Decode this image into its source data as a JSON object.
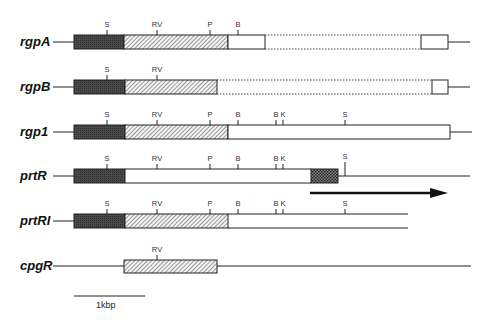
{
  "figure": {
    "type": "gene-map",
    "scale_bar": {
      "label": "1kbp"
    },
    "rows": [
      {
        "name": "rgpA",
        "sites": [
          {
            "label": "S",
            "x": 107
          },
          {
            "label": "RV",
            "x": 157
          },
          {
            "label": "P",
            "x": 210
          },
          {
            "label": "B",
            "x": 238
          }
        ],
        "segments": [
          "dark",
          "hatched",
          "open",
          "dotted",
          "open"
        ]
      },
      {
        "name": "rgpB",
        "sites": [
          {
            "label": "S",
            "x": 107
          },
          {
            "label": "RV",
            "x": 157
          }
        ],
        "segments": [
          "dark",
          "hatched",
          "dotted",
          "open"
        ]
      },
      {
        "name": "rgp1",
        "sites": [
          {
            "label": "S",
            "x": 107
          },
          {
            "label": "RV",
            "x": 157
          },
          {
            "label": "P",
            "x": 210
          },
          {
            "label": "B",
            "x": 238
          },
          {
            "label": "B",
            "x": 276
          },
          {
            "label": "K",
            "x": 283
          },
          {
            "label": "S",
            "x": 345
          }
        ],
        "segments": [
          "dark",
          "hatched",
          "open"
        ]
      },
      {
        "name": "prtR",
        "sites": [
          {
            "label": "S",
            "x": 107
          },
          {
            "label": "RV",
            "x": 157
          },
          {
            "label": "P",
            "x": 210
          },
          {
            "label": "B",
            "x": 238
          },
          {
            "label": "B",
            "x": 276
          },
          {
            "label": "K",
            "x": 283
          },
          {
            "label": "S",
            "x": 345
          }
        ],
        "segments": [
          "dark",
          "open",
          "stippled"
        ],
        "arrow": "transcription direction"
      },
      {
        "name": "prtRI",
        "sites": [
          {
            "label": "S",
            "x": 107
          },
          {
            "label": "RV",
            "x": 157
          },
          {
            "label": "P",
            "x": 210
          },
          {
            "label": "B",
            "x": 238
          },
          {
            "label": "B",
            "x": 276
          },
          {
            "label": "K",
            "x": 283
          },
          {
            "label": "S",
            "x": 345
          }
        ],
        "segments": [
          "dark",
          "hatched",
          "open"
        ]
      },
      {
        "name": "cpgR",
        "sites": [
          {
            "label": "RV",
            "x": 157
          }
        ],
        "segments": [
          "hatched"
        ]
      }
    ],
    "colors": {
      "dark": "#444444",
      "hatch": "#555555",
      "stipple": "#333333",
      "line": "#222222"
    }
  }
}
